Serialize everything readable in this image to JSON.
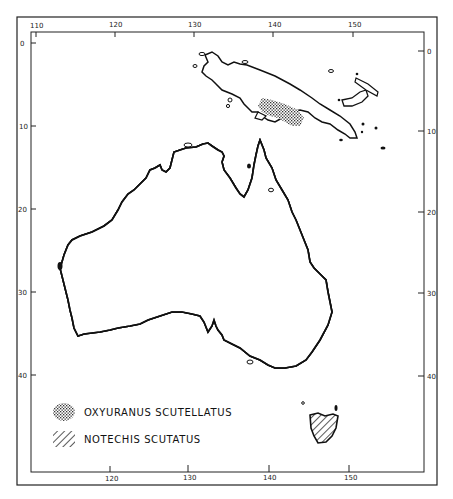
{
  "figure": {
    "type": "distribution-map",
    "region": "Australia and New Guinea",
    "colors": {
      "ink": "#111111",
      "paper": "#ffffff"
    }
  },
  "axes": {
    "top_longitude_labels": [
      "110",
      "120",
      "130",
      "140",
      "150"
    ],
    "bottom_longitude_labels": [
      "120",
      "130",
      "140",
      "150"
    ],
    "left_latitude_labels": [
      "0",
      "10",
      "20",
      "30",
      "40"
    ],
    "right_latitude_labels": [
      "0",
      "10",
      "20",
      "30",
      "40"
    ]
  },
  "legend": {
    "items": [
      {
        "label": "OXYURANUS SCUTELLATUS",
        "pattern": "dotted-crosshatch"
      },
      {
        "label": "NOTECHIS SCUTATUS",
        "pattern": "diagonal-hatch"
      }
    ]
  }
}
